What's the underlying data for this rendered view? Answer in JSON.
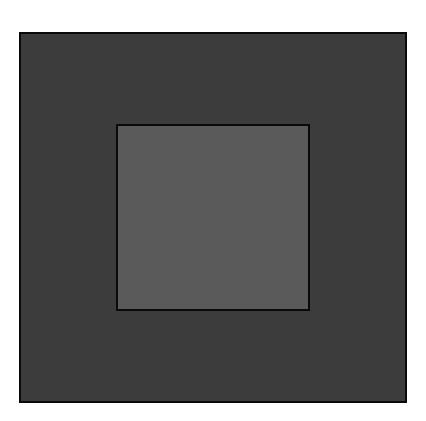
{
  "diagram": {
    "background": "#ffffff",
    "shapes": [
      {
        "id": "outer-square",
        "type": "rect",
        "x": 19,
        "y": 32,
        "width": 388,
        "height": 371,
        "fill": "#3c3c3c",
        "stroke": "#0a0a0a",
        "stroke_width": 2
      },
      {
        "id": "inner-square",
        "type": "rect",
        "x": 116,
        "y": 124,
        "width": 194,
        "height": 187,
        "fill": "#5a5a5a",
        "stroke": "#0a0a0a",
        "stroke_width": 2
      }
    ]
  }
}
